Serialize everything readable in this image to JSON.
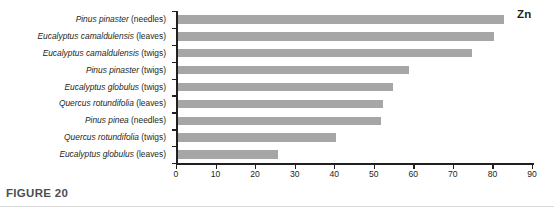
{
  "figure": {
    "caption": "FIGURE 20",
    "series_label": "Zn"
  },
  "chart_data": {
    "type": "bar",
    "orientation": "horizontal",
    "title": "",
    "subtitle": "",
    "xlabel": "",
    "ylabel": "",
    "xlim": [
      0,
      90
    ],
    "xticks": [
      0,
      10,
      20,
      30,
      40,
      50,
      60,
      70,
      80,
      90
    ],
    "grid": false,
    "legend": "none",
    "bar_color": "#a6a6a6",
    "axis_color": "#231f20",
    "series": [
      {
        "name": "Zn",
        "values": [
          82.5,
          80.0,
          74.5,
          58.5,
          54.5,
          52.0,
          51.5,
          40.0,
          25.5
        ]
      }
    ],
    "categories": [
      "Pinus pinaster (needles)",
      "Eucalyptus camaldulensis (leaves)",
      "Eucalyptus camaldulensis (twigs)",
      "Pinus pinaster (twigs)",
      "Eucalyptus globulus (twigs)",
      "Quercus rotundifolia (leaves)",
      "Pinus pinea (needles)",
      "Quercus rotundifolia (twigs)",
      "Eucalyptus globulus (leaves)"
    ],
    "categories_parts": [
      {
        "species": "Pinus pinaster",
        "part": " (needles)"
      },
      {
        "species": "Eucalyptus camaldulensis",
        "part": " (leaves)"
      },
      {
        "species": "Eucalyptus camaldulensis",
        "part": " (twigs)"
      },
      {
        "species": "Pinus pinaster",
        "part": " (twigs)"
      },
      {
        "species": "Eucalyptus globulus",
        "part": " (twigs)"
      },
      {
        "species": "Quercus rotundifolia",
        "part": " (leaves)"
      },
      {
        "species": "Pinus pinea",
        "part": " (needles)"
      },
      {
        "species": "Quercus rotundifolia",
        "part": " (twigs)"
      },
      {
        "species": "Eucalyptus globulus",
        "part": " (leaves)"
      }
    ],
    "xtick_labels": [
      "0",
      "10",
      "20",
      "30",
      "40",
      "50",
      "60",
      "70",
      "80",
      "90"
    ]
  }
}
